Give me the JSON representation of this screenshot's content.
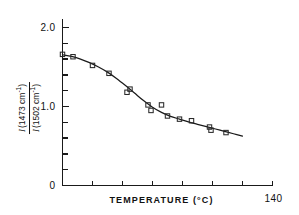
{
  "chart_data": {
    "type": "scatter",
    "title": "",
    "subtitle": "",
    "xlabel": "TEMPERATURE (°C)",
    "ylabel": "I (1473 cm⁻¹) / I (1502 cm⁻¹)",
    "ylabel_numerator_symbol": "I",
    "ylabel_numerator_text": "(1473 cm",
    "ylabel_numerator_sup": "-1",
    "ylabel_numerator_close": ")",
    "ylabel_denominator_symbol": "I",
    "ylabel_denominator_text": "(1502 cm",
    "ylabel_denominator_sup": "-1",
    "ylabel_denominator_close": ")",
    "xlim": [
      0,
      140
    ],
    "ylim": [
      0,
      2.2
    ],
    "grid": false,
    "legend": "none",
    "x_ticks": [
      0,
      20,
      40,
      60,
      80,
      100,
      120,
      140
    ],
    "x_tick_labels": [
      "0",
      "",
      "",
      "",
      "",
      "",
      "",
      "140"
    ],
    "x_origin_label": "0",
    "x_end_label": "140",
    "y_ticks": [
      0,
      0.2,
      0.4,
      0.6,
      0.8,
      1.0,
      1.2,
      1.4,
      1.6,
      1.8,
      2.0
    ],
    "y_tick_labels": [
      "0",
      "",
      "",
      "",
      "",
      "1.0",
      "",
      "",
      "",
      "",
      "2.0"
    ],
    "y_major_labels": [
      {
        "value": 2.0,
        "label": "2.0"
      },
      {
        "value": 1.0,
        "label": "1.0"
      },
      {
        "value": 0.0,
        "label": "0"
      }
    ],
    "marker_style": "open-square",
    "series": [
      {
        "name": "intensity ratio",
        "points": [
          {
            "x": 0,
            "y": 1.66
          },
          {
            "x": 7,
            "y": 1.63
          },
          {
            "x": 20,
            "y": 1.52
          },
          {
            "x": 31,
            "y": 1.42
          },
          {
            "x": 43,
            "y": 1.18
          },
          {
            "x": 45,
            "y": 1.22
          },
          {
            "x": 57,
            "y": 1.02
          },
          {
            "x": 59,
            "y": 0.95
          },
          {
            "x": 66,
            "y": 1.02
          },
          {
            "x": 70,
            "y": 0.88
          },
          {
            "x": 78,
            "y": 0.84
          },
          {
            "x": 86,
            "y": 0.82
          },
          {
            "x": 98,
            "y": 0.74
          },
          {
            "x": 99,
            "y": 0.7
          },
          {
            "x": 109,
            "y": 0.67
          }
        ]
      }
    ],
    "fit_curve": {
      "name": "smooth fit",
      "points": [
        {
          "x": 0,
          "y": 1.655
        },
        {
          "x": 6,
          "y": 1.635
        },
        {
          "x": 12,
          "y": 1.6
        },
        {
          "x": 18,
          "y": 1.555
        },
        {
          "x": 24,
          "y": 1.5
        },
        {
          "x": 30,
          "y": 1.435
        },
        {
          "x": 36,
          "y": 1.355
        },
        {
          "x": 42,
          "y": 1.265
        },
        {
          "x": 48,
          "y": 1.17
        },
        {
          "x": 54,
          "y": 1.075
        },
        {
          "x": 60,
          "y": 0.99
        },
        {
          "x": 66,
          "y": 0.925
        },
        {
          "x": 72,
          "y": 0.875
        },
        {
          "x": 78,
          "y": 0.84
        },
        {
          "x": 84,
          "y": 0.805
        },
        {
          "x": 90,
          "y": 0.775
        },
        {
          "x": 96,
          "y": 0.745
        },
        {
          "x": 102,
          "y": 0.715
        },
        {
          "x": 108,
          "y": 0.685
        },
        {
          "x": 114,
          "y": 0.655
        },
        {
          "x": 120,
          "y": 0.625
        }
      ]
    }
  },
  "figure": {
    "background_color": "#ffffff",
    "ink_color": "#111111"
  }
}
